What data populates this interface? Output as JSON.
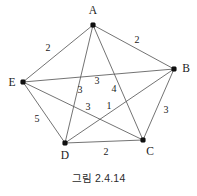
{
  "figure": {
    "caption": "그림 2.4.14",
    "width": 197,
    "height": 196,
    "background_color": "#ffffff",
    "edge_color": "#5a5a5a",
    "vertex_color": "#111111",
    "text_color": "#1a1a1a"
  },
  "chart_data": {
    "type": "diagram",
    "diagram_type": "weighted-undirected-graph",
    "title": "그림 2.4.14",
    "nodes": [
      {
        "id": "A",
        "label": "A",
        "x": 93,
        "y": 25,
        "label_x": 93,
        "label_y": 14
      },
      {
        "id": "B",
        "label": "B",
        "x": 174,
        "y": 69,
        "label_x": 186,
        "label_y": 72
      },
      {
        "id": "C",
        "label": "C",
        "x": 143,
        "y": 140,
        "label_x": 150,
        "label_y": 155
      },
      {
        "id": "D",
        "label": "D",
        "x": 65,
        "y": 143,
        "label_x": 65,
        "label_y": 159
      },
      {
        "id": "E",
        "label": "E",
        "x": 23,
        "y": 82,
        "label_x": 12,
        "label_y": 86
      }
    ],
    "edges": [
      {
        "from": "A",
        "to": "E",
        "weight": 2,
        "label_x": 48,
        "label_y": 51
      },
      {
        "from": "A",
        "to": "B",
        "weight": 2,
        "label_x": 137,
        "label_y": 43
      },
      {
        "from": "A",
        "to": "D",
        "weight": 3,
        "label_x": 80,
        "label_y": 93
      },
      {
        "from": "A",
        "to": "C",
        "weight": 4,
        "label_x": 114,
        "label_y": 92
      },
      {
        "from": "E",
        "to": "B",
        "weight": 3,
        "label_x": 97,
        "label_y": 84
      },
      {
        "from": "E",
        "to": "C",
        "weight": 1,
        "label_x": 109,
        "label_y": 109
      },
      {
        "from": "E",
        "to": "D",
        "weight": 5,
        "label_x": 37,
        "label_y": 122
      },
      {
        "from": "B",
        "to": "D",
        "weight": 3,
        "label_x": 88,
        "label_y": 110
      },
      {
        "from": "B",
        "to": "C",
        "weight": 3,
        "label_x": 166,
        "label_y": 113
      },
      {
        "from": "D",
        "to": "C",
        "weight": 2,
        "label_x": 106,
        "label_y": 155
      }
    ],
    "node_count": 5,
    "edge_count": 10,
    "weights": [
      2,
      2,
      3,
      4,
      3,
      1,
      5,
      3,
      3,
      2
    ]
  }
}
